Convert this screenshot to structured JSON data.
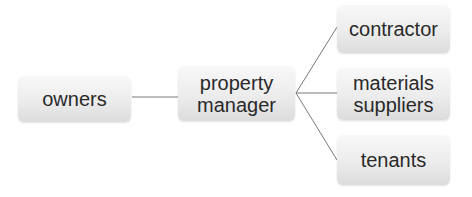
{
  "diagram": {
    "type": "hierarchy",
    "nodes": [
      {
        "id": "owners",
        "label": "owners"
      },
      {
        "id": "property_manager",
        "label": "property manager",
        "lines": [
          "property",
          "manager"
        ]
      },
      {
        "id": "contractor",
        "label": "contractor"
      },
      {
        "id": "materials_suppliers",
        "label": "materials suppliers",
        "lines": [
          "materials",
          "suppliers"
        ]
      },
      {
        "id": "tenants",
        "label": "tenants"
      }
    ],
    "edges": [
      {
        "from": "owners",
        "to": "property_manager"
      },
      {
        "from": "property_manager",
        "to": "contractor"
      },
      {
        "from": "property_manager",
        "to": "materials_suppliers"
      },
      {
        "from": "property_manager",
        "to": "tenants"
      }
    ],
    "colors": {
      "box_top": "#f8f8f8",
      "box_bottom": "#dcdcdc",
      "text": "#2a2a2a",
      "line": "#7a7a7a"
    }
  }
}
